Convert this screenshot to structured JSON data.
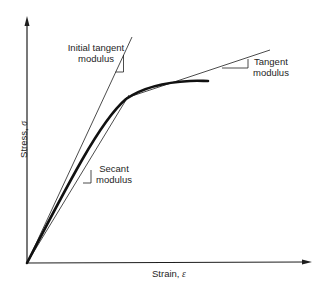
{
  "figure": {
    "type": "stress-strain curve with modulus definitions",
    "axes": {
      "x_label": "Strain, ",
      "x_symbol": "ε",
      "y_label": "Stress, ",
      "y_symbol": "σ"
    },
    "annotations": {
      "initial_tangent": {
        "line1": "Initial tangent",
        "line2": "modulus"
      },
      "tangent": {
        "line1": "Tangent",
        "line2": "modulus"
      },
      "secant": {
        "line1": "Secant",
        "line2": "modulus"
      }
    },
    "colors": {
      "background": "#ffffff",
      "ink": "#1e1e1e"
    }
  }
}
